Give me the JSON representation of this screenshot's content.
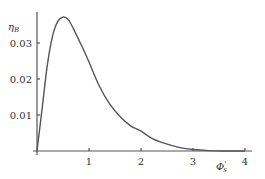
{
  "chart_data": {
    "type": "line",
    "title": "",
    "xlabel": "Φ'_s",
    "ylabel": "η_B",
    "xlim": [
      0,
      4
    ],
    "ylim": [
      0,
      0.04
    ],
    "xticks": [
      1,
      2,
      3,
      4
    ],
    "yticks": [
      0.01,
      0.02,
      0.03
    ],
    "xtick_labels": [
      "1",
      "2",
      "3",
      "4"
    ],
    "ytick_labels": [
      "0.01",
      "0.02",
      "0.03"
    ],
    "grid": false,
    "legend": null,
    "series": [
      {
        "name": "η_B",
        "color": "#555555",
        "x": [
          0,
          0.1,
          0.2,
          0.3,
          0.4,
          0.5,
          0.6,
          0.7,
          0.8,
          0.9,
          1.0,
          1.2,
          1.4,
          1.6,
          1.8,
          2.0,
          2.2,
          2.4,
          2.6,
          2.8,
          3.0,
          3.3,
          3.6,
          4.0
        ],
        "y": [
          0,
          0.012,
          0.024,
          0.032,
          0.036,
          0.0372,
          0.0365,
          0.034,
          0.031,
          0.028,
          0.0247,
          0.018,
          0.013,
          0.0095,
          0.007,
          0.0055,
          0.0036,
          0.0024,
          0.0015,
          0.0008,
          0.0004,
          0.0001,
          0.0,
          0.0
        ]
      }
    ]
  },
  "labels": {
    "y_axis_main": "η",
    "y_axis_sub": "B",
    "x_axis_main": "Φ",
    "x_axis_prime": "'",
    "x_axis_sub": "s"
  }
}
